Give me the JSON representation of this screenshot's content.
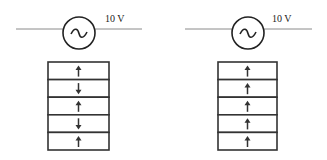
{
  "panels": [
    {
      "id": "left",
      "source": {
        "label": "10 V",
        "symbol": "ac-source"
      },
      "stack": {
        "arrows": [
          "up",
          "down",
          "up",
          "down",
          "up"
        ]
      },
      "geom": {
        "wire_x1": 16,
        "wire_x2": 142,
        "wire_y": 29,
        "cx": 79,
        "cy": 33,
        "r": 16,
        "label_x": 105,
        "label_y": 22,
        "box_x": 48,
        "box_y": 62,
        "box_w": 61,
        "row_h": 17.6
      }
    },
    {
      "id": "right",
      "source": {
        "label": "10 V",
        "symbol": "ac-source"
      },
      "stack": {
        "arrows": [
          "up",
          "up",
          "up",
          "up",
          "up"
        ]
      },
      "geom": {
        "wire_x1": 185,
        "wire_x2": 312,
        "wire_y": 29,
        "cx": 248,
        "cy": 33,
        "r": 16,
        "label_x": 272,
        "label_y": 22,
        "box_x": 218,
        "box_y": 62,
        "box_w": 59,
        "row_h": 17.6
      }
    }
  ]
}
